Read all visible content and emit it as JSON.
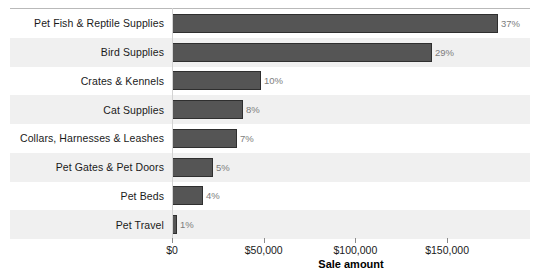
{
  "chart_data": {
    "type": "bar",
    "orientation": "horizontal",
    "title": "",
    "xlabel": "Sale amount",
    "ylabel": "",
    "categories": [
      "Pet Fish & Reptile Supplies",
      "Bird Supplies",
      "Crates & Kennels",
      "Cat Supplies",
      "Collars, Harnesses & Leashes",
      "Pet Gates & Pet Doors",
      "Pet Beds",
      "Pet Travel"
    ],
    "values": [
      177700,
      141800,
      48500,
      38700,
      35400,
      22300,
      16900,
      2700
    ],
    "data_labels": [
      "37%",
      "29%",
      "10%",
      "8%",
      "7%",
      "5%",
      "4%",
      "1%"
    ],
    "percent_values": [
      37,
      29,
      10,
      8,
      7,
      5,
      4,
      1
    ],
    "xlim": [
      0,
      195000
    ],
    "xticks": [
      0,
      50000,
      100000,
      150000
    ],
    "xtick_labels": [
      "$0",
      "$50,000",
      "$100,000",
      "$150,000"
    ],
    "grid": false,
    "legend": false,
    "banded_rows": true,
    "colors": {
      "bar_fill": "#555555",
      "bar_border": "#2f2f2f",
      "band": "#f0f0f0",
      "background": "#ffffff",
      "axis_line": "#9a9a9a",
      "data_label": "#7d7d7d",
      "text": "#1a1a1a"
    }
  }
}
